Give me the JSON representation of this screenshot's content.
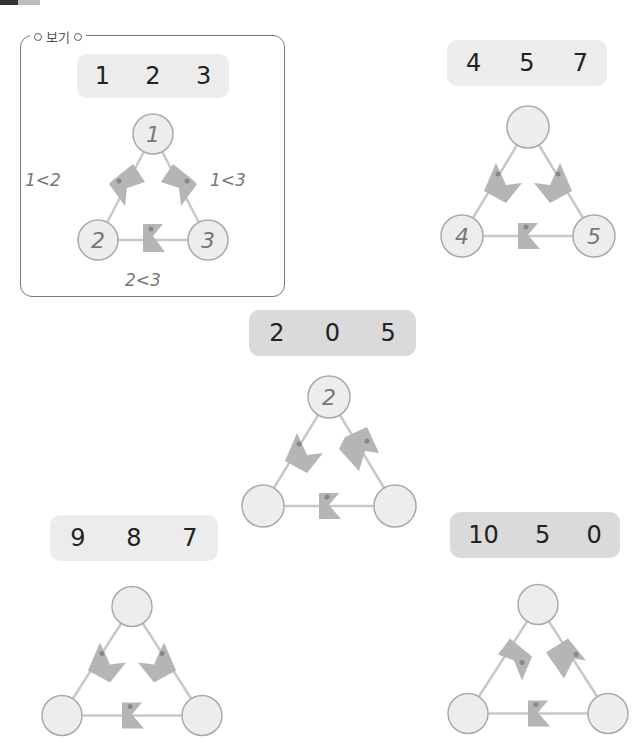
{
  "header": {
    "corner_icons": [
      "dark-tab-icon",
      "light-tab-icon"
    ]
  },
  "example": {
    "label": "보기",
    "numbers": [
      "1",
      "2",
      "3"
    ],
    "nodes": {
      "top": "1",
      "left": "2",
      "right": "3"
    },
    "annotations": {
      "left": "1<2",
      "right": "1<3",
      "bottom": "2<3"
    }
  },
  "problems": [
    {
      "numbers": [
        "4",
        "5",
        "7"
      ],
      "nodes": {
        "top": "",
        "left": "4",
        "right": "5"
      }
    },
    {
      "numbers": [
        "2",
        "0",
        "5"
      ],
      "nodes": {
        "top": "2",
        "left": "",
        "right": ""
      }
    },
    {
      "numbers": [
        "9",
        "8",
        "7"
      ],
      "nodes": {
        "top": "",
        "left": "",
        "right": ""
      }
    },
    {
      "numbers": [
        "10",
        "5",
        "0"
      ],
      "nodes": {
        "top": "",
        "left": "",
        "right": ""
      }
    }
  ],
  "colors": {
    "node_fill": "#ededed",
    "node_stroke": "#aaaaaa",
    "pacman": "#b5b5b5",
    "line": "#c8c8c8",
    "pill": "#ececec"
  }
}
